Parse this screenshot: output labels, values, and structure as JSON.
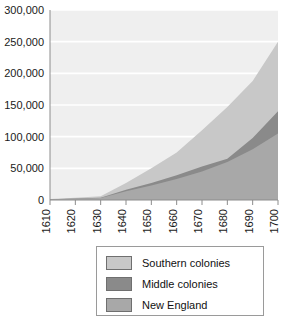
{
  "chart_data": {
    "type": "area",
    "stacked": true,
    "title": "",
    "xlabel": "",
    "ylabel": "",
    "categories": [
      1610,
      1620,
      1630,
      1640,
      1650,
      1660,
      1670,
      1680,
      1690,
      1700
    ],
    "xtick_labels": [
      "1610",
      "1620",
      "1630",
      "1640",
      "1650",
      "1660",
      "1670",
      "1680",
      "1690",
      "1700"
    ],
    "ytick_labels": [
      "0",
      "50,000",
      "100,000",
      "150,000",
      "200,000",
      "250,000",
      "300,000"
    ],
    "ytick_values": [
      0,
      50000,
      100000,
      150000,
      200000,
      250000,
      300000
    ],
    "ylim": [
      0,
      300000
    ],
    "xlim": [
      1610,
      1700
    ],
    "grid": true,
    "grid_axis": "y",
    "legend_position": "below",
    "series": [
      {
        "name": "New England",
        "color": "#a8a8a8",
        "values": [
          1000,
          2000,
          3000,
          14000,
          23000,
          33000,
          45000,
          60000,
          80000,
          105000
        ]
      },
      {
        "name": "Middle colonies",
        "color": "#8a8a8a",
        "values": [
          0,
          500,
          500,
          2000,
          4000,
          6000,
          8000,
          5000,
          18000,
          35000
        ]
      },
      {
        "name": "Southern colonies",
        "color": "#c8c8c8",
        "values": [
          500,
          1000,
          2500,
          11000,
          23000,
          36000,
          57000,
          82000,
          90000,
          110000
        ]
      }
    ],
    "stack_tops": {
      "new_england": [
        1000,
        2000,
        3000,
        14000,
        23000,
        33000,
        45000,
        60000,
        80000,
        105000
      ],
      "plus_middle": [
        1000,
        2500,
        3500,
        16000,
        27000,
        39000,
        53000,
        65000,
        98000,
        140000
      ],
      "total": [
        1500,
        3500,
        6000,
        27000,
        50000,
        75000,
        110000,
        147000,
        188000,
        250000
      ]
    }
  },
  "legend": {
    "items": [
      {
        "label": "Southern colonies",
        "color": "#c8c8c8"
      },
      {
        "label": "Middle colonies",
        "color": "#8a8a8a"
      },
      {
        "label": "New England",
        "color": "#a8a8a8"
      }
    ]
  },
  "colors": {
    "plot_background": "#efefef",
    "gridline": "#ffffff",
    "axis": "#8c8c8c",
    "text": "#1a1a1a"
  }
}
